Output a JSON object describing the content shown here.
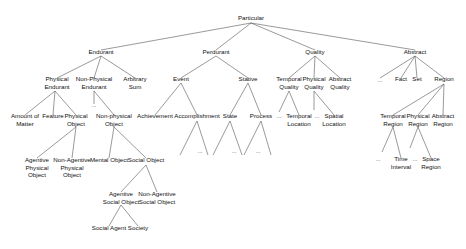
{
  "diagram": {
    "title": "Particular",
    "nodes": [
      {
        "id": "particular",
        "lines": [
          "Particular"
        ],
        "x": 251,
        "y": 20
      },
      {
        "id": "endurant",
        "lines": [
          "Endurant"
        ],
        "x": 101,
        "y": 54
      },
      {
        "id": "perdurant",
        "lines": [
          "Perdurant"
        ],
        "x": 216,
        "y": 54
      },
      {
        "id": "quality",
        "lines": [
          "Quality"
        ],
        "x": 315,
        "y": 54
      },
      {
        "id": "abstract",
        "lines": [
          "Abstract"
        ],
        "x": 415,
        "y": 54
      },
      {
        "id": "physical-endurant",
        "lines": [
          "Physical",
          "Endurant"
        ],
        "x": 57,
        "y": 81
      },
      {
        "id": "non-physical-endurant",
        "lines": [
          "Non-Physical",
          "Endurant"
        ],
        "x": 94,
        "y": 81
      },
      {
        "id": "arbitrary-sum",
        "lines": [
          "Arbitrary",
          "Sum"
        ],
        "x": 135,
        "y": 81
      },
      {
        "id": "event",
        "lines": [
          "Event"
        ],
        "x": 181,
        "y": 81
      },
      {
        "id": "stative",
        "lines": [
          "Stative"
        ],
        "x": 248,
        "y": 81
      },
      {
        "id": "temporal-quality",
        "lines": [
          "Temporal",
          "Quality"
        ],
        "x": 289,
        "y": 81
      },
      {
        "id": "physical-quality",
        "lines": [
          "Physical",
          "Quality"
        ],
        "x": 314,
        "y": 81
      },
      {
        "id": "abstract-quality",
        "lines": [
          "Abstract",
          "Quality"
        ],
        "x": 340,
        "y": 81
      },
      {
        "id": "abstract-ellipsis",
        "lines": [
          "..."
        ],
        "x": 380,
        "y": 82
      },
      {
        "id": "fact",
        "lines": [
          "Fact"
        ],
        "x": 401,
        "y": 81
      },
      {
        "id": "set",
        "lines": [
          "Set"
        ],
        "x": 417,
        "y": 81
      },
      {
        "id": "region",
        "lines": [
          "Region"
        ],
        "x": 444,
        "y": 81
      },
      {
        "id": "non-physical-endurant-ellipsis",
        "lines": [
          "..."
        ],
        "x": 94,
        "y": 107
      },
      {
        "id": "amount-of-matter",
        "lines": [
          "Amount of",
          "Matter"
        ],
        "x": 25,
        "y": 118
      },
      {
        "id": "feature",
        "lines": [
          "Feature"
        ],
        "x": 53,
        "y": 118
      },
      {
        "id": "physical-object",
        "lines": [
          "Physical",
          "Object"
        ],
        "x": 76,
        "y": 118
      },
      {
        "id": "non-physical-object",
        "lines": [
          "Non-physical",
          "Object"
        ],
        "x": 114,
        "y": 118
      },
      {
        "id": "achievement",
        "lines": [
          "Achievement"
        ],
        "x": 155,
        "y": 118
      },
      {
        "id": "accomplishment",
        "lines": [
          "Accomplishment"
        ],
        "x": 197,
        "y": 118
      },
      {
        "id": "state",
        "lines": [
          "State"
        ],
        "x": 230,
        "y": 118
      },
      {
        "id": "process",
        "lines": [
          "Process"
        ],
        "x": 261,
        "y": 118
      },
      {
        "id": "temporal-quality-ellipsis",
        "lines": [
          "..."
        ],
        "x": 279,
        "y": 118
      },
      {
        "id": "temporal-location",
        "lines": [
          "Temporal",
          "Location"
        ],
        "x": 299,
        "y": 118
      },
      {
        "id": "physical-quality-ellipsis",
        "lines": [
          "..."
        ],
        "x": 317,
        "y": 118
      },
      {
        "id": "spatial-location",
        "lines": [
          "Spatial",
          "Location"
        ],
        "x": 334,
        "y": 118
      },
      {
        "id": "temporal-region",
        "lines": [
          "Temporal",
          "Region"
        ],
        "x": 393,
        "y": 118
      },
      {
        "id": "physical-region",
        "lines": [
          "Physical",
          "Region"
        ],
        "x": 418,
        "y": 118
      },
      {
        "id": "abstract-region",
        "lines": [
          "Abstract",
          "Region"
        ],
        "x": 443,
        "y": 118
      },
      {
        "id": "accomplishment-ellipsis",
        "lines": [
          "..."
        ],
        "x": 200,
        "y": 153
      },
      {
        "id": "state-ellipsis",
        "lines": [
          "..."
        ],
        "x": 234,
        "y": 153
      },
      {
        "id": "process-ellipsis",
        "lines": [
          "..."
        ],
        "x": 258,
        "y": 153
      },
      {
        "id": "agentive-physical-object",
        "lines": [
          "Agentive",
          "Physical",
          "Object"
        ],
        "x": 37,
        "y": 162
      },
      {
        "id": "non-agentive-physical-object",
        "lines": [
          "Non-Agentive",
          "Physical",
          "Object"
        ],
        "x": 72,
        "y": 162
      },
      {
        "id": "mental-object",
        "lines": [
          "Mental Object"
        ],
        "x": 109,
        "y": 162
      },
      {
        "id": "social-object",
        "lines": [
          "Social Object"
        ],
        "x": 146,
        "y": 162
      },
      {
        "id": "temporal-region-ellipsis",
        "lines": [
          "..."
        ],
        "x": 378,
        "y": 161
      },
      {
        "id": "time-interval",
        "lines": [
          "Time",
          "Interval"
        ],
        "x": 401,
        "y": 161
      },
      {
        "id": "physical-region-ellipsis",
        "lines": [
          "..."
        ],
        "x": 415,
        "y": 161
      },
      {
        "id": "space-region",
        "lines": [
          "Space",
          "Region"
        ],
        "x": 431,
        "y": 161
      },
      {
        "id": "agentive-social-object",
        "lines": [
          "Agentive",
          "Social Object"
        ],
        "x": 121,
        "y": 196
      },
      {
        "id": "non-agentive-social-object",
        "lines": [
          "Non-Agentive",
          "Social Object"
        ],
        "x": 157,
        "y": 196
      },
      {
        "id": "social-agent",
        "lines": [
          "Social Agent"
        ],
        "x": 109,
        "y": 230
      },
      {
        "id": "society",
        "lines": [
          "Society"
        ],
        "x": 138,
        "y": 230
      }
    ],
    "edges": [
      [
        251,
        23,
        101,
        50
      ],
      [
        251,
        23,
        216,
        50
      ],
      [
        251,
        23,
        315,
        50
      ],
      [
        251,
        23,
        415,
        50
      ],
      [
        101,
        56,
        57,
        78
      ],
      [
        101,
        56,
        94,
        78
      ],
      [
        101,
        56,
        135,
        78
      ],
      [
        216,
        56,
        181,
        78
      ],
      [
        216,
        56,
        248,
        78
      ],
      [
        315,
        56,
        289,
        78
      ],
      [
        315,
        56,
        314,
        78
      ],
      [
        315,
        56,
        340,
        78
      ],
      [
        415,
        56,
        380,
        78
      ],
      [
        415,
        56,
        401,
        78
      ],
      [
        415,
        56,
        417,
        78
      ],
      [
        415,
        56,
        444,
        78
      ],
      [
        55,
        91,
        25,
        115
      ],
      [
        55,
        91,
        53,
        115
      ],
      [
        55,
        91,
        76,
        115
      ],
      [
        94,
        91,
        94,
        104
      ],
      [
        94,
        91,
        114,
        115
      ],
      [
        181,
        83,
        155,
        115
      ],
      [
        181,
        83,
        197,
        115
      ],
      [
        248,
        83,
        230,
        115
      ],
      [
        248,
        83,
        261,
        115
      ],
      [
        289,
        91,
        279,
        112
      ],
      [
        289,
        91,
        299,
        115
      ],
      [
        314,
        91,
        314,
        110
      ],
      [
        314,
        91,
        334,
        115
      ],
      [
        444,
        84,
        393,
        115
      ],
      [
        444,
        84,
        418,
        115
      ],
      [
        444,
        84,
        443,
        115
      ],
      [
        197,
        121,
        180,
        155
      ],
      [
        197,
        121,
        208,
        155
      ],
      [
        230,
        121,
        213,
        155
      ],
      [
        230,
        121,
        242,
        155
      ],
      [
        261,
        121,
        244,
        155
      ],
      [
        261,
        121,
        271,
        155
      ],
      [
        76,
        127,
        37,
        158
      ],
      [
        76,
        127,
        72,
        158
      ],
      [
        114,
        127,
        109,
        158
      ],
      [
        114,
        127,
        146,
        158
      ],
      [
        393,
        127,
        382,
        152
      ],
      [
        393,
        127,
        401,
        158
      ],
      [
        418,
        127,
        410,
        148
      ],
      [
        418,
        127,
        431,
        158
      ],
      [
        146,
        165,
        121,
        192
      ],
      [
        146,
        165,
        157,
        192
      ],
      [
        121,
        205,
        109,
        226
      ],
      [
        121,
        205,
        138,
        226
      ]
    ]
  }
}
